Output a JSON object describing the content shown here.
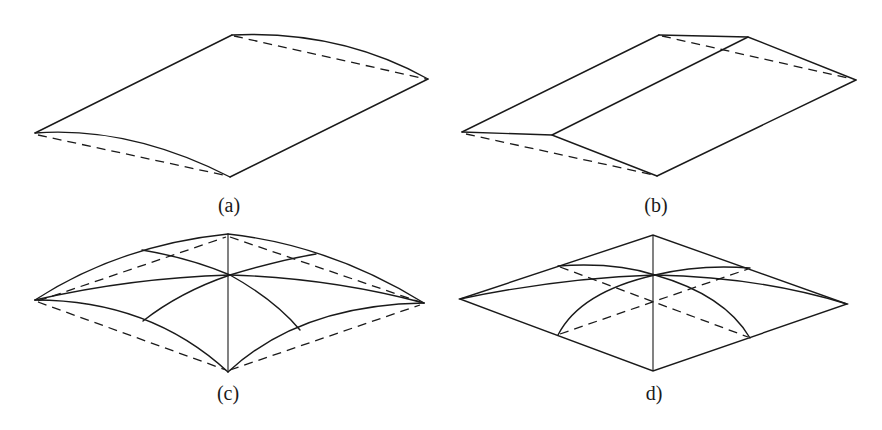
{
  "figure": {
    "panels": [
      {
        "id": "a",
        "label": "(a)",
        "description": "Cylindrical shell: curved (arched) surface over rectangular plan, dashed chords show the flat base edges"
      },
      {
        "id": "b",
        "label": "(b)",
        "description": "Folded plate / gable roof: two planar slopes meeting at a ridge, dashed lines show the base edges"
      },
      {
        "id": "c",
        "label": "(c)",
        "description": "Domed shell over square plan with curved edges and meridian arcs through the crown; dashed lines show the square base"
      },
      {
        "id": "d",
        "label": "d)",
        "description": "Dome on square plan with straight plan edges; curved arcs meet at the crown, dashed diagonals show hidden lines"
      }
    ],
    "colors": {
      "line": "#1a1a1a",
      "background": "#ffffff"
    }
  }
}
